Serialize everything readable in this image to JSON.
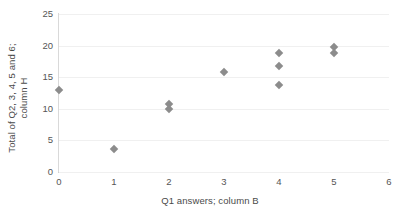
{
  "chart_data": {
    "type": "scatter",
    "title": "",
    "xlabel": "Q1 answers; column B",
    "ylabel_line1": "Total of Q2, 3, 4, 5 and 6;",
    "ylabel_line2": "column H",
    "ylabel": "Total of Q2, 3, 4, 5 and 6; column H",
    "xlim": [
      0,
      6
    ],
    "ylim": [
      0,
      25
    ],
    "xticks": [
      0,
      1,
      2,
      3,
      4,
      5,
      6
    ],
    "yticks": [
      0,
      5,
      10,
      15,
      20,
      25
    ],
    "xtick_labels": [
      "0",
      "1",
      "2",
      "3",
      "4",
      "5",
      "6"
    ],
    "ytick_labels": [
      "0",
      "5",
      "10",
      "15",
      "20",
      "25"
    ],
    "grid": "horizontal",
    "legend": "none",
    "marker": "diamond",
    "marker_color": "#8c8c8c",
    "points": [
      {
        "x": 0,
        "y": 13.0
      },
      {
        "x": 1,
        "y": 3.7
      },
      {
        "x": 2,
        "y": 10.7
      },
      {
        "x": 2,
        "y": 9.9
      },
      {
        "x": 3,
        "y": 15.8
      },
      {
        "x": 4,
        "y": 18.8
      },
      {
        "x": 4,
        "y": 16.8
      },
      {
        "x": 4,
        "y": 13.8
      },
      {
        "x": 5,
        "y": 19.8
      },
      {
        "x": 5,
        "y": 18.8
      }
    ]
  }
}
